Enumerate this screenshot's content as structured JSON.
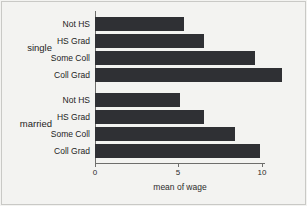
{
  "chart_data": {
    "type": "bar",
    "orientation": "horizontal",
    "title": "",
    "xlabel": "mean of wage",
    "ylabel": "",
    "xlim": [
      0,
      11.8
    ],
    "xticks": [
      0,
      5,
      10
    ],
    "xtick_labels": [
      "0",
      "5",
      "10"
    ],
    "grid": false,
    "legend": "none",
    "bar_color": "#2f3034",
    "background_color": "#f3f3f1",
    "groups": [
      {
        "name": "single",
        "categories": [
          "Not HS",
          "HS Grad",
          "Some Coll",
          "Coll Grad"
        ],
        "values": [
          5.3,
          6.5,
          9.6,
          11.2
        ]
      },
      {
        "name": "married",
        "categories": [
          "Not HS",
          "HS Grad",
          "Some Coll",
          "Coll Grad"
        ],
        "values": [
          5.1,
          6.5,
          8.4,
          9.9
        ]
      }
    ]
  }
}
